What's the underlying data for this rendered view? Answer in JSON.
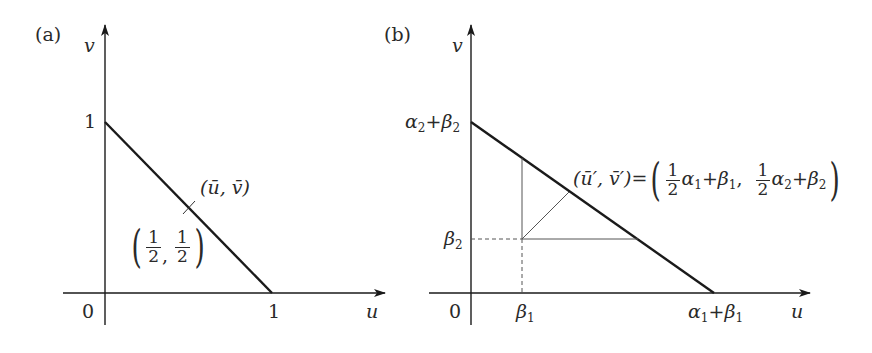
{
  "panel_a": {
    "label": "(a)",
    "axis_x": "u",
    "axis_y": "v",
    "origin": "0",
    "tick_x": "1",
    "tick_y": "1",
    "point_label": "(ū, v̄)",
    "point_u": "ū",
    "point_v": "v̄",
    "point_value": {
      "open": "(",
      "close": ")",
      "num1": "1",
      "den1": "2",
      "sep": ",",
      "num2": "1",
      "den2": "2"
    }
  },
  "panel_b": {
    "label": "(b)",
    "axis_x": "u",
    "axis_y": "v",
    "origin": "0",
    "tick_x_beta": "β",
    "tick_x_beta_sub": "1",
    "tick_x_end_alpha": "α",
    "tick_x_end_alpha_sub": "1",
    "tick_x_end_plus": "+",
    "tick_x_end_beta": "β",
    "tick_x_end_beta_sub": "1",
    "tick_y_beta": "β",
    "tick_y_beta_sub": "2",
    "tick_y_top_alpha": "α",
    "tick_y_top_alpha_sub": "2",
    "tick_y_top_plus": "+",
    "tick_y_top_beta": "β",
    "tick_y_top_beta_sub": "2",
    "point_lhs": "(ū′, v̄′)",
    "equals": "=",
    "rhs": {
      "num": "1",
      "den": "2",
      "a1": "α",
      "a1_sub": "1",
      "plus1": "+",
      "b1": "β",
      "b1_sub": "1",
      "comma": ",",
      "a2": "α",
      "a2_sub": "2",
      "plus2": "+",
      "b2": "β",
      "b2_sub": "2"
    }
  },
  "colors": {
    "line": "#1a1a1a",
    "thin": "#555555",
    "background": "#ffffff"
  }
}
